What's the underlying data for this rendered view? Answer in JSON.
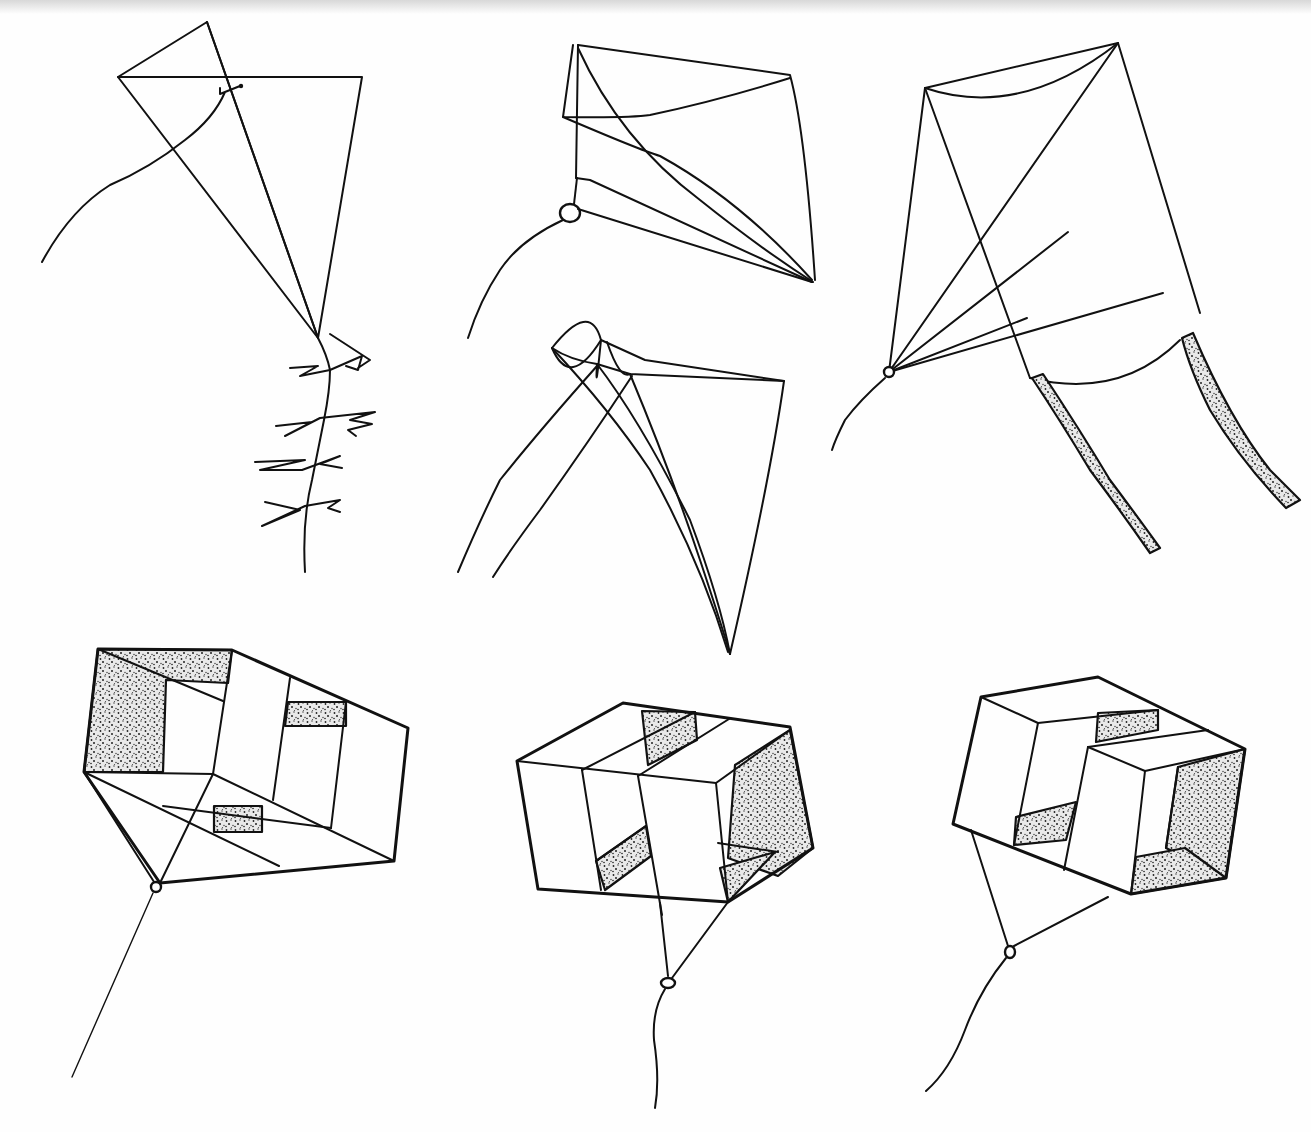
{
  "illustration": {
    "subject": "Hand-drawn kite types",
    "background_color": "#fefefe",
    "ink_color": "#111111",
    "kites": [
      {
        "id": "diamond",
        "label": "Diamond kite with bow tail",
        "position": "top-left"
      },
      {
        "id": "sled-1",
        "label": "Sled kite",
        "position": "top-center"
      },
      {
        "id": "sled-2",
        "label": "Sled kite with two tails",
        "position": "middle-center"
      },
      {
        "id": "delta-streamers",
        "label": "Kite with two shaded streamers",
        "position": "top-right"
      },
      {
        "id": "box-1",
        "label": "Box kite",
        "position": "bottom-left"
      },
      {
        "id": "box-2",
        "label": "Box kite",
        "position": "bottom-center"
      },
      {
        "id": "box-3",
        "label": "Box kite",
        "position": "bottom-right"
      }
    ]
  }
}
